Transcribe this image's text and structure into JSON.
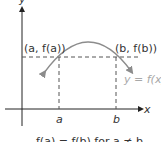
{
  "diagram": {
    "type": "function-graph",
    "axes": {
      "x_label": "x",
      "y_label": "y"
    },
    "points": {
      "left_label": "(a, f(a))",
      "right_label": "(b, f(b))"
    },
    "curve_label": "y = f(x)",
    "x_ticks": [
      "a",
      "b"
    ],
    "caption": "f(a) = f(b) for a ≠ b",
    "colors": {
      "axis": "#222222",
      "curve": "#8c8c8c",
      "dashed": "#555555",
      "curve_label": "#a8a8a8"
    }
  }
}
